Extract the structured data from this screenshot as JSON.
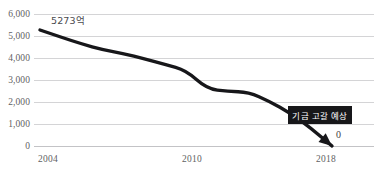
{
  "chart_data": {
    "type": "line",
    "title": "",
    "subtitle": "",
    "xlabel": "",
    "ylabel": "",
    "grid": true,
    "legend": "none",
    "xlim": [
      2004,
      2018
    ],
    "ylim": [
      0,
      6000
    ],
    "y_ticks": [
      "6,000",
      "5,000",
      "4,000",
      "3,000",
      "2,000",
      "1,000",
      "0"
    ],
    "y_tick_values": [
      6000,
      5000,
      4000,
      3000,
      2000,
      1000,
      0
    ],
    "x_ticks": [
      "2004",
      "2010",
      "2018"
    ],
    "x_tick_values": [
      2004,
      2010,
      2018
    ],
    "series": [
      {
        "name": "기금 잔액",
        "x": [
          2004,
          2005,
          2006,
          2007,
          2008,
          2009,
          2010,
          2011,
          2012,
          2013,
          2014,
          2015,
          2016,
          2017,
          2018
        ],
        "values": [
          5273,
          4950,
          4640,
          4380,
          4200,
          3960,
          3700,
          3450,
          2600,
          2480,
          2450,
          2030,
          1500,
          800,
          0
        ],
        "color": "#17171a",
        "arrow_end": true
      }
    ],
    "annotations": [
      {
        "name": "start-value",
        "text": "5273억",
        "x": 2004,
        "y": 5273
      },
      {
        "name": "depletion-callout",
        "text": "기금 고갈 예상",
        "x": 2016,
        "y": 1450
      },
      {
        "name": "end-value",
        "text": "0",
        "x": 2018,
        "y": 0
      }
    ],
    "colors": {
      "line": "#17171a",
      "grid": "#d4d4d6",
      "callout_bg": "#17171a",
      "callout_text": "#ffffff",
      "tick_text": "#5f5f63"
    }
  }
}
